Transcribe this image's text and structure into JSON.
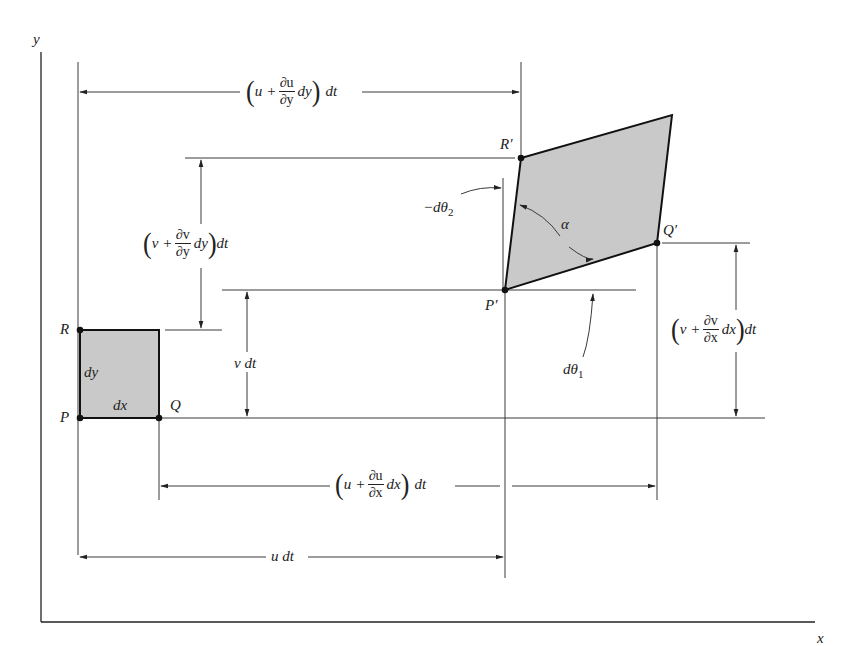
{
  "figure": {
    "type": "fluid-element-kinematics",
    "axes": {
      "x_label": "x",
      "y_label": "y"
    },
    "original_element": {
      "points": {
        "P": "P",
        "Q": "Q",
        "R": "R"
      },
      "side_labels": {
        "horizontal": "dx",
        "vertical": "dy"
      }
    },
    "deformed_element": {
      "points": {
        "P_prime": "P′",
        "Q_prime": "Q′",
        "R_prime": "R′"
      },
      "angle_label": "α"
    },
    "angles": {
      "d_theta_1": {
        "d": "dθ",
        "sub": "1"
      },
      "d_theta_2": {
        "prefix": "−dθ",
        "sub": "2"
      }
    },
    "dimensions": {
      "top_horizontal": {
        "lead": "u",
        "plus": "+",
        "num": "∂u",
        "den": "∂y",
        "tail": "dy",
        "dt": "dt"
      },
      "left_vertical": {
        "lead": "v",
        "plus": "+",
        "num": "∂v",
        "den": "∂y",
        "tail": "dy",
        "dt": "dt"
      },
      "v_dt": "v dt",
      "right_vertical": {
        "lead": "v",
        "plus": "+",
        "num": "∂v",
        "den": "∂x",
        "tail": "dx",
        "dt": "dt"
      },
      "bottom_horizontal": {
        "lead": "u",
        "plus": "+",
        "num": "∂u",
        "den": "∂x",
        "tail": "dx",
        "dt": "dt"
      },
      "u_dt": "u dt"
    },
    "colors": {
      "fill": "#c9c9c9",
      "line": "#222222",
      "background": "#ffffff"
    }
  }
}
